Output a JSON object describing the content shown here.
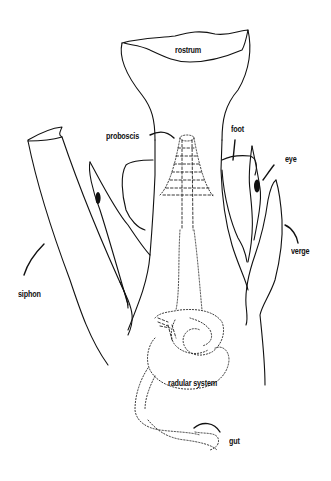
{
  "figure": {
    "colors": {
      "ink": "#111111",
      "background": "#ffffff"
    },
    "labels": [
      {
        "id": "rostrum",
        "text": "rostrum",
        "x": 175,
        "y": 45
      },
      {
        "id": "proboscis",
        "text": "proboscis",
        "x": 106,
        "y": 131
      },
      {
        "id": "foot",
        "text": "foot",
        "x": 231,
        "y": 124
      },
      {
        "id": "eye",
        "text": "eye",
        "x": 285,
        "y": 154
      },
      {
        "id": "verge",
        "text": "verge",
        "x": 291,
        "y": 246
      },
      {
        "id": "siphon",
        "text": "siphon",
        "x": 18,
        "y": 289
      },
      {
        "id": "radular_system",
        "text": "radular system",
        "x": 168,
        "y": 378
      },
      {
        "id": "gut",
        "text": "gut",
        "x": 229,
        "y": 436
      }
    ]
  }
}
